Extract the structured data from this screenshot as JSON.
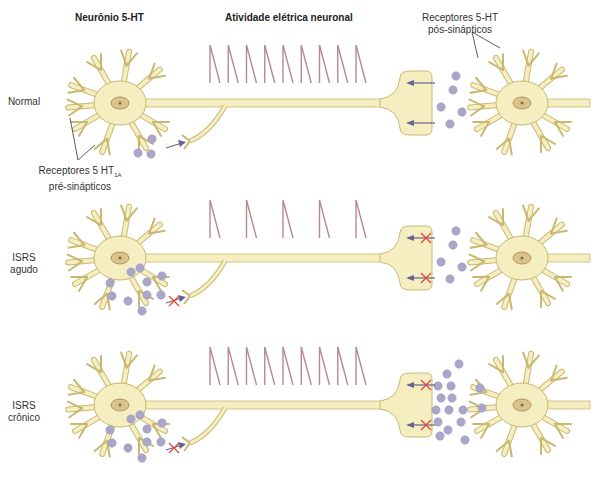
{
  "titles": {
    "neuron": "Neurônio 5-HT",
    "activity": "Atividade elétrica neuronal"
  },
  "annotations": {
    "post_receptors_line1": "Receptores 5-HT",
    "post_receptors_line2": "pós-sinápticos",
    "pre_receptors_line1": "Receptores 5 HT",
    "pre_receptors_sub": "1A",
    "pre_receptors_line2": "pré-sinápticos"
  },
  "rows": [
    {
      "label_line1": "Normal",
      "label_line2": "",
      "spike_count": 9,
      "autoreceptor_blocked": false,
      "reuptake_blocked": false,
      "presynaptic_dots": 3,
      "synaptic_dots": 5
    },
    {
      "label_line1": "ISRS",
      "label_line2": "agudo",
      "spike_count": 5,
      "autoreceptor_blocked": true,
      "reuptake_blocked": true,
      "presynaptic_dots": 10,
      "synaptic_dots": 5
    },
    {
      "label_line1": "ISRS",
      "label_line2": "crônico",
      "spike_count": 9,
      "autoreceptor_blocked": true,
      "reuptake_blocked": true,
      "presynaptic_dots": 10,
      "synaptic_dots": 16
    }
  ],
  "colors": {
    "neuron_fill": "#f5eec0",
    "neuron_stroke": "#c9b870",
    "nucleus": "#d9c28c",
    "spike": "#b88a8e",
    "serotonin_dot": "#aaa6c8",
    "arrow": "#6a6390",
    "block_x": "#e0453a"
  }
}
